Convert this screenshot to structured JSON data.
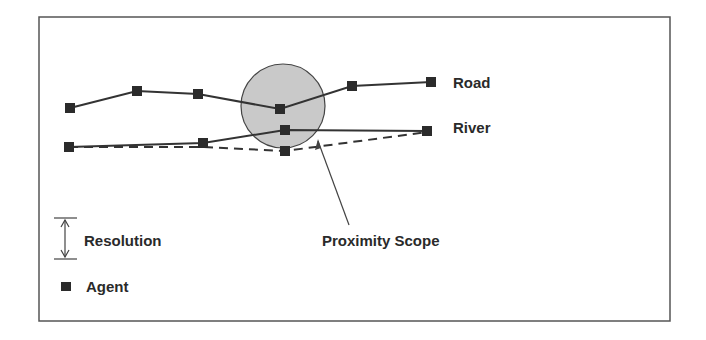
{
  "figure": {
    "labels": {
      "road": "Road",
      "river": "River",
      "proximity_scope": "Proximity Scope",
      "resolution": "Resolution",
      "agent": "Agent"
    },
    "legend": [
      {
        "symbol": "double-arrow-icon",
        "label": "Resolution"
      },
      {
        "symbol": "agent-square-icon",
        "label": "Agent"
      }
    ],
    "features": [
      {
        "name": "Road",
        "style": "solid",
        "agent_count": 6
      },
      {
        "name": "River",
        "style": "solid + dashed",
        "agent_count": 5
      }
    ],
    "colors": {
      "ink": "#2b2b2b",
      "scope_fill": "#c9c9c9",
      "background": "#ffffff"
    }
  }
}
